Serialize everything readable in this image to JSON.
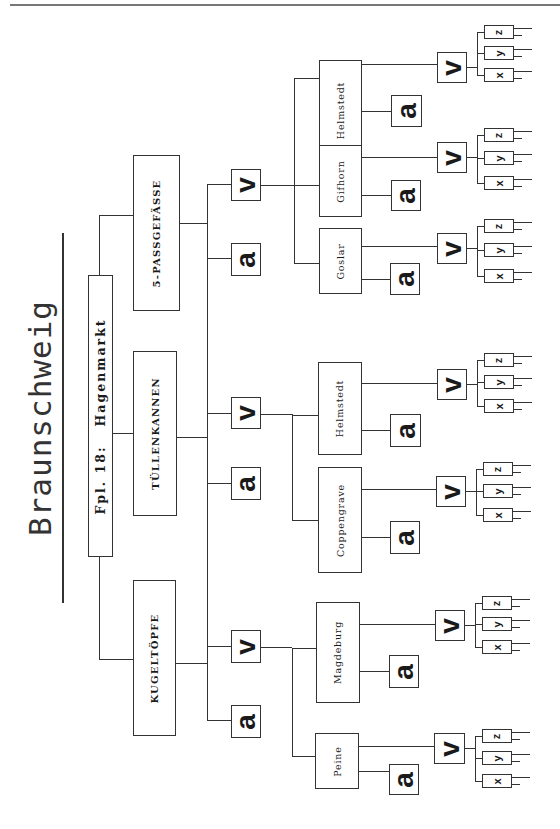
{
  "header": {
    "rule": "top-rule"
  },
  "title": "Braunschweig",
  "root": {
    "label": "Fpl. 18:   Hagenmarkt"
  },
  "categories": [
    {
      "label": "KUGELTÖPFE"
    },
    {
      "label": "TÜLLENKANNEN"
    },
    {
      "label": "5-PASSGEFÄSSE"
    }
  ],
  "symbols": {
    "a": "a",
    "v": "v",
    "x": "x",
    "y": "y",
    "z": "z"
  },
  "cities": [
    {
      "label": "Peine",
      "category": "KUGELTÖPFE"
    },
    {
      "label": "Magdeburg",
      "category": "KUGELTÖPFE"
    },
    {
      "label": "Coppengrave",
      "category": "TÜLLENKANNEN"
    },
    {
      "label": "Helmstedt",
      "category": "TÜLLENKANNEN"
    },
    {
      "label": "Goslar",
      "category": "5-PASSGEFÄSSE"
    },
    {
      "label": "Gifhorn",
      "category": "5-PASSGEFÄSSE"
    },
    {
      "label": "Helmstedt",
      "category": "5-PASSGEFÄSSE"
    }
  ],
  "colors": {
    "ink": "#333333",
    "background": "#ffffff"
  }
}
